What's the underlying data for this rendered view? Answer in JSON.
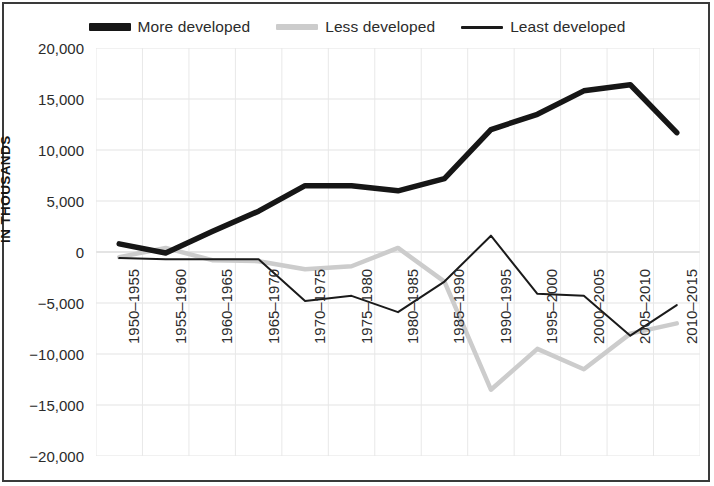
{
  "legend": {
    "position": "top-center",
    "items": [
      {
        "label": "More developed",
        "key": "more",
        "color": "#161616",
        "style": "thick-solid"
      },
      {
        "label": "Less developed",
        "key": "less",
        "color": "#cccccc",
        "style": "medium-solid"
      },
      {
        "label": "Least developed",
        "key": "least",
        "color": "#1a1a1a",
        "style": "thin-solid"
      }
    ]
  },
  "axis": {
    "y_title": "IN THOUSANDS",
    "y_ticks": [
      "20,000",
      "15,000",
      "10,000",
      "5,000",
      "0",
      "-5,000",
      "-10,000",
      "-15,000",
      "-20,000"
    ]
  },
  "chart_data": {
    "type": "line",
    "title": "",
    "subtitle": "",
    "xlabel": "",
    "ylabel": "IN THOUSANDS",
    "ylim": [
      -20000,
      20000
    ],
    "ytick_step": 5000,
    "grid": true,
    "legend_position": "top-center",
    "categories": [
      "1950-1955",
      "1955-1960",
      "1960-1965",
      "1965-1970",
      "1970-1975",
      "1975-1980",
      "1980-1985",
      "1985-1990",
      "1990-1995",
      "1995-2000",
      "2000-2005",
      "2005-2010",
      "2010-2015"
    ],
    "series": [
      {
        "name": "More developed",
        "color": "#161616",
        "width": 5.5,
        "values": [
          800,
          -100,
          2000,
          4000,
          6500,
          6500,
          6000,
          7200,
          12000,
          13500,
          15800,
          16400,
          11700
        ]
      },
      {
        "name": "Less developed",
        "color": "#cccccc",
        "width": 4.5,
        "values": [
          -500,
          400,
          -800,
          -900,
          -1700,
          -1400,
          400,
          -2900,
          -13500,
          -9500,
          -11500,
          -8000,
          -7000
        ]
      },
      {
        "name": "Least developed",
        "color": "#1a1a1a",
        "width": 2,
        "values": [
          -600,
          -700,
          -700,
          -700,
          -4800,
          -4300,
          -5900,
          -2900,
          1600,
          -4100,
          -4300,
          -8200,
          -5200
        ]
      }
    ]
  }
}
